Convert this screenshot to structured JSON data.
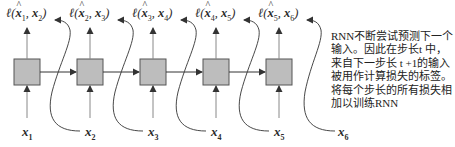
{
  "diagram": {
    "type": "RNN next-step prediction unrolled",
    "colors": {
      "cell_fill": "#bdbdbd",
      "cell_stroke": "#555555",
      "arrow": "#333333",
      "text": "#2b2b2b"
    },
    "cells": [
      {
        "index": 1,
        "loss": {
          "pred": "x",
          "pred_sub": "1",
          "target": "x",
          "target_sub": "2"
        },
        "input": {
          "var": "x",
          "sub": "1"
        }
      },
      {
        "index": 2,
        "loss": {
          "pred": "x",
          "pred_sub": "2",
          "target": "x",
          "target_sub": "3"
        },
        "input": {
          "var": "x",
          "sub": "2"
        }
      },
      {
        "index": 3,
        "loss": {
          "pred": "x",
          "pred_sub": "3",
          "target": "x",
          "target_sub": "4"
        },
        "input": {
          "var": "x",
          "sub": "3"
        }
      },
      {
        "index": 4,
        "loss": {
          "pred": "x",
          "pred_sub": "4",
          "target": "x",
          "target_sub": "5"
        },
        "input": {
          "var": "x",
          "sub": "4"
        }
      },
      {
        "index": 5,
        "loss": {
          "pred": "x",
          "pred_sub": "5",
          "target": "x",
          "target_sub": "6"
        },
        "input": {
          "var": "x",
          "sub": "5"
        }
      }
    ],
    "extra_input": {
      "var": "x",
      "sub": "6"
    },
    "loss_symbol": "ℓ",
    "annotation": {
      "lines": [
        "RNN不断尝试预测下一个",
        "输入。因此在步长t 中，",
        "来自下一步长 t +1的输入",
        "被用作计算损失的标签。",
        "将每个步长的所有损失相",
        "加以训练RNN"
      ]
    }
  }
}
